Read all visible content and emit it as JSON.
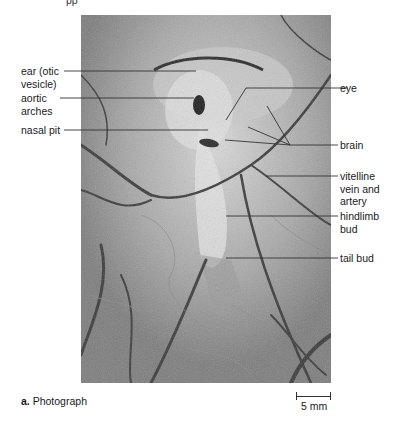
{
  "figure": {
    "top_fragment": "pp",
    "photo_alt": "Chick embryo photograph on yolk with blood vessels",
    "labels_left": [
      {
        "id": "ear",
        "text": "ear (otic\nvesicle)"
      },
      {
        "id": "aortic-arches",
        "text": "aortic\narches"
      },
      {
        "id": "nasal-pit",
        "text": "nasal pit"
      }
    ],
    "labels_right": [
      {
        "id": "eye",
        "text": "eye"
      },
      {
        "id": "brain",
        "text": "brain"
      },
      {
        "id": "vitelline",
        "text": "vitelline\nvein and\nartery"
      },
      {
        "id": "hindlimb-bud",
        "text": "hindlimb\nbud"
      },
      {
        "id": "tail-bud",
        "text": "tail bud"
      }
    ],
    "caption": {
      "letter": "a.",
      "text": " Photograph"
    },
    "scale_bar": {
      "label": "5 mm"
    },
    "colors": {
      "line": "#333333",
      "text": "#1a1a1a",
      "background": "#ffffff"
    }
  }
}
